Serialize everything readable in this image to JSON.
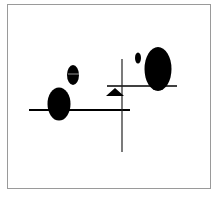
{
  "figure": {
    "frame_color": "#9a9a9a",
    "ink_color": "#000000",
    "background": "#ffffff",
    "shapes": {
      "ellipse_small_mid": {
        "cx": 73,
        "cy": 75,
        "rx": 6,
        "ry": 10
      },
      "ellipse_large_left": {
        "cx": 59,
        "cy": 104,
        "rx": 11.5,
        "ry": 16.5
      },
      "ellipse_dot": {
        "cx": 138,
        "cy": 58,
        "rx": 3,
        "ry": 5.5
      },
      "ellipse_large_right": {
        "cx": 158,
        "cy": 69,
        "rx": 13.5,
        "ry": 22
      },
      "line_horizontal_left": {
        "x1": 29,
        "y1": 110,
        "x2": 130,
        "y2": 110
      },
      "line_horizontal_right": {
        "x1": 107,
        "y1": 86,
        "x2": 177,
        "y2": 86
      },
      "line_vertical": {
        "x1": 122,
        "y1": 59,
        "x2": 122,
        "y2": 152
      },
      "triangle": {
        "points": "106,96 115,88 124,96"
      }
    }
  }
}
